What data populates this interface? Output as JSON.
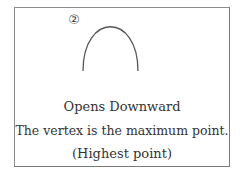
{
  "figure": {
    "number_label": "②",
    "curve": "parabola-opening-downward",
    "lines": [
      "Opens Downward",
      "The vertex is the maximum point.",
      "(Highest point)"
    ],
    "colors": {
      "stroke": "#555555",
      "border": "#8a8a8a",
      "text": "#333333"
    }
  }
}
